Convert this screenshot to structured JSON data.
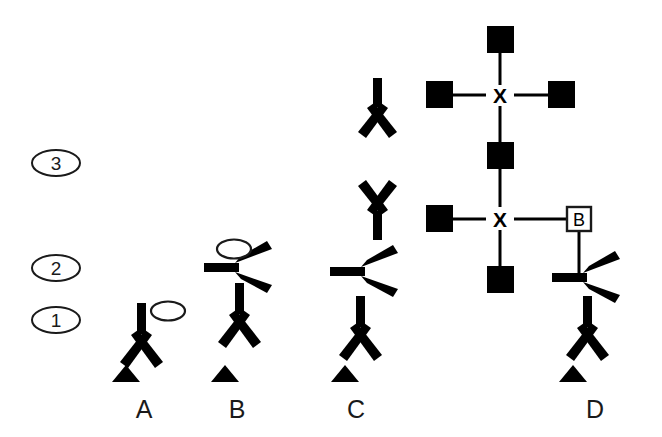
{
  "figure": {
    "title": "",
    "background_color": "#ffffff",
    "ink_color": "#000000",
    "width": 662,
    "height": 437
  },
  "stage_labels": [
    {
      "id": "stage-3",
      "text": "3",
      "cx": 56,
      "cy": 163,
      "rx": 24,
      "ry": 13
    },
    {
      "id": "stage-2",
      "text": "2",
      "cx": 56,
      "cy": 268,
      "rx": 24,
      "ry": 13
    },
    {
      "id": "stage-1",
      "text": "1",
      "cx": 56,
      "cy": 320,
      "rx": 24,
      "ry": 13
    }
  ],
  "panel_labels": [
    {
      "id": "panel-a",
      "text": "A",
      "x": 144,
      "y": 418
    },
    {
      "id": "panel-b",
      "text": "B",
      "x": 237,
      "y": 418
    },
    {
      "id": "panel-c",
      "text": "C",
      "x": 356,
      "y": 418
    },
    {
      "id": "panel-d",
      "text": "D",
      "x": 595,
      "y": 418
    }
  ],
  "node_labels": {
    "cross_center": "X",
    "boxed_node": "B"
  },
  "panels": {
    "a": {
      "name": "A",
      "branch_units": 1,
      "ellipses": 1,
      "triangles": 1,
      "squares": 0,
      "crosses": 0
    },
    "b": {
      "name": "B",
      "branch_units": 2,
      "ellipses": 1,
      "triangles": 1,
      "squares": 0,
      "crosses": 0
    },
    "c": {
      "name": "C",
      "branch_units": 4,
      "ellipses": 0,
      "triangles": 1,
      "squares": 0,
      "crosses": 0
    },
    "d": {
      "name": "D",
      "branch_units": 2,
      "ellipses": 0,
      "triangles": 1,
      "squares": 6,
      "crosses": 2,
      "boxed_nodes": 1
    }
  },
  "shape_legend": {
    "filled_square": "filled-square",
    "open_square": "open-square-with-letter",
    "ellipse": "open-ellipse",
    "triangle": "filled-triangle",
    "branch": "y-branch"
  }
}
